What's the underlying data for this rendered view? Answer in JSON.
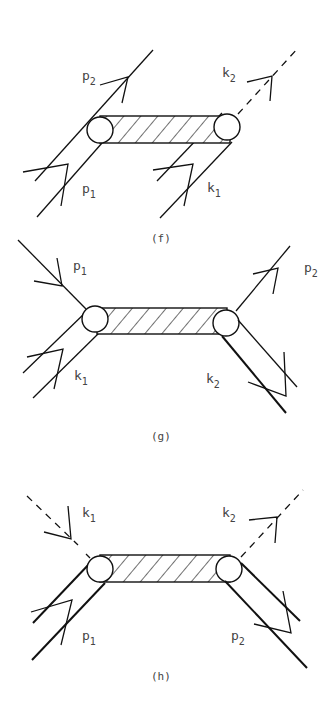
{
  "diagrams": [
    {
      "id": "f",
      "caption": "(f)",
      "labels": {
        "p2": {
          "base": "p",
          "sub": "2"
        },
        "k2": {
          "base": "k",
          "sub": "2"
        },
        "p1": {
          "base": "p",
          "sub": "1"
        },
        "k1": {
          "base": "k",
          "sub": "1"
        }
      }
    },
    {
      "id": "g",
      "caption": "(g)",
      "labels": {
        "p1": {
          "base": "p",
          "sub": "1"
        },
        "p2": {
          "base": "p",
          "sub": "2"
        },
        "k1": {
          "base": "k",
          "sub": "1"
        },
        "k2": {
          "base": "k",
          "sub": "2"
        }
      }
    },
    {
      "id": "h",
      "caption": "(h)",
      "labels": {
        "k1": {
          "base": "k",
          "sub": "1"
        },
        "k2": {
          "base": "k",
          "sub": "2"
        },
        "p1": {
          "base": "p",
          "sub": "1"
        },
        "p2": {
          "base": "p",
          "sub": "2"
        }
      }
    }
  ]
}
